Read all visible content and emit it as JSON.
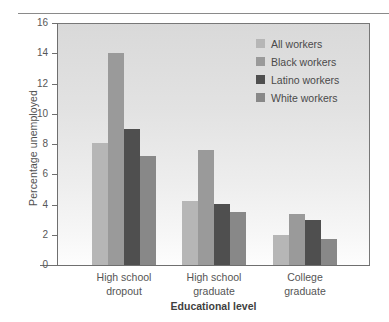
{
  "chart_data": {
    "type": "bar",
    "title": "",
    "xlabel": "Educational level",
    "ylabel": "Percentage unemployed",
    "categories": [
      "High school dropout",
      "High school graduate",
      "College graduate"
    ],
    "category_lines": [
      [
        "High school",
        "dropout"
      ],
      [
        "High school",
        "graduate"
      ],
      [
        "College",
        "graduate"
      ]
    ],
    "series": [
      {
        "name": "All workers",
        "color": "#b6b6b6",
        "values": [
          8.1,
          4.2,
          2.0
        ]
      },
      {
        "name": "Black workers",
        "color": "#9a9a9a",
        "values": [
          14.0,
          7.6,
          3.4
        ]
      },
      {
        "name": "Latino workers",
        "color": "#4f4f4f",
        "values": [
          9.0,
          4.05,
          3.0
        ]
      },
      {
        "name": "White workers",
        "color": "#888888",
        "values": [
          7.2,
          3.5,
          1.75
        ]
      }
    ],
    "ylim": [
      0,
      16
    ],
    "yticks": [
      0,
      2,
      4,
      6,
      8,
      10,
      12,
      14,
      16
    ],
    "ytick_labels": [
      "0",
      "2",
      "4",
      "6",
      "8",
      "10",
      "12",
      "14",
      "16"
    ],
    "grid": false,
    "legend_position": "top-right",
    "plot_background": "#e6e6e6"
  }
}
